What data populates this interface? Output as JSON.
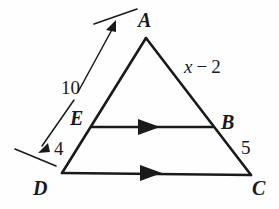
{
  "figure": {
    "background_color": "#fefefe",
    "stroke_color": "#1a1a1a",
    "vertices": {
      "A": {
        "label": "A",
        "x": 146,
        "y": 38,
        "label_x": 138,
        "label_y": 10
      },
      "B": {
        "label": "B",
        "x": 213,
        "y": 127,
        "label_x": 221,
        "label_y": 112
      },
      "C": {
        "label": "C",
        "x": 251,
        "y": 175,
        "label_x": 252,
        "label_y": 178
      },
      "D": {
        "label": "D",
        "x": 62,
        "y": 173,
        "label_x": 33,
        "label_y": 178
      },
      "E": {
        "label": "E",
        "x": 92,
        "y": 127,
        "label_x": 70,
        "label_y": 108
      }
    },
    "segment_labels": [
      {
        "name": "ae-measure",
        "text": "10",
        "x": 61,
        "y": 78
      },
      {
        "name": "ed-measure",
        "text": "4",
        "x": 54,
        "y": 139
      },
      {
        "name": "ab-expression",
        "var": "x",
        "op": "−",
        "num": "2",
        "x": 184,
        "y": 57
      },
      {
        "name": "bc-measure",
        "text": "5",
        "x": 241,
        "y": 138
      }
    ],
    "parallel_marks": [
      {
        "name": "eb-arrow-mark",
        "x": 148,
        "y": 127
      },
      {
        "name": "dc-arrow-mark",
        "x": 150,
        "y": 173
      }
    ],
    "dimension_arrows": [
      {
        "name": "ten-dimension-arrow",
        "from_x": 40,
        "from_y": 150,
        "to_x": 114,
        "to_y": 21
      },
      {
        "name": "four-dimension-arrow",
        "from_x": 74,
        "from_y": 96,
        "to_x": 40,
        "to_y": 150
      }
    ],
    "extension_ticks": [
      {
        "name": "top-extension-tick",
        "x1": 94,
        "y1": 24,
        "x2": 137,
        "y2": 9
      },
      {
        "name": "bottom-extension-tick",
        "x1": 15,
        "y1": 149,
        "x2": 56,
        "y2": 166
      }
    ]
  }
}
